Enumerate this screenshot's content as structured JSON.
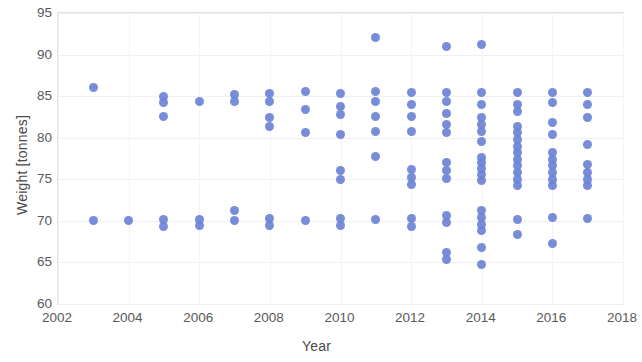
{
  "chart_data": {
    "type": "scatter",
    "title": "",
    "xlabel": "Year",
    "ylabel": "Weight [tonnes]",
    "xlim": [
      2002,
      2018
    ],
    "ylim": [
      60,
      95
    ],
    "xticks": [
      2002,
      2004,
      2006,
      2008,
      2010,
      2012,
      2014,
      2016,
      2018
    ],
    "yticks": [
      60,
      65,
      70,
      75,
      80,
      85,
      90,
      95
    ],
    "grid": true,
    "legend": null,
    "marker_color": "#6b83d6",
    "points": [
      {
        "x": 2003,
        "y": 86.0
      },
      {
        "x": 2003,
        "y": 70.0
      },
      {
        "x": 2004,
        "y": 70.1
      },
      {
        "x": 2005,
        "y": 85.0
      },
      {
        "x": 2005,
        "y": 84.2
      },
      {
        "x": 2005,
        "y": 82.6
      },
      {
        "x": 2005,
        "y": 70.2
      },
      {
        "x": 2005,
        "y": 69.3
      },
      {
        "x": 2006,
        "y": 84.3
      },
      {
        "x": 2006,
        "y": 70.2
      },
      {
        "x": 2006,
        "y": 69.4
      },
      {
        "x": 2007,
        "y": 85.2
      },
      {
        "x": 2007,
        "y": 84.3
      },
      {
        "x": 2007,
        "y": 71.2
      },
      {
        "x": 2007,
        "y": 70.1
      },
      {
        "x": 2008,
        "y": 85.3
      },
      {
        "x": 2008,
        "y": 84.4
      },
      {
        "x": 2008,
        "y": 82.4
      },
      {
        "x": 2008,
        "y": 81.4
      },
      {
        "x": 2008,
        "y": 70.3
      },
      {
        "x": 2008,
        "y": 69.4
      },
      {
        "x": 2009,
        "y": 85.5
      },
      {
        "x": 2009,
        "y": 83.4
      },
      {
        "x": 2009,
        "y": 80.6
      },
      {
        "x": 2009,
        "y": 70.1
      },
      {
        "x": 2010,
        "y": 85.3
      },
      {
        "x": 2010,
        "y": 83.8
      },
      {
        "x": 2010,
        "y": 82.8
      },
      {
        "x": 2010,
        "y": 80.4
      },
      {
        "x": 2010,
        "y": 76.0
      },
      {
        "x": 2010,
        "y": 75.0
      },
      {
        "x": 2010,
        "y": 70.3
      },
      {
        "x": 2010,
        "y": 69.4
      },
      {
        "x": 2011,
        "y": 92.0
      },
      {
        "x": 2011,
        "y": 85.5
      },
      {
        "x": 2011,
        "y": 84.4
      },
      {
        "x": 2011,
        "y": 82.6
      },
      {
        "x": 2011,
        "y": 80.8
      },
      {
        "x": 2011,
        "y": 77.8
      },
      {
        "x": 2011,
        "y": 70.2
      },
      {
        "x": 2012,
        "y": 85.4
      },
      {
        "x": 2012,
        "y": 84.0
      },
      {
        "x": 2012,
        "y": 82.6
      },
      {
        "x": 2012,
        "y": 80.8
      },
      {
        "x": 2012,
        "y": 76.2
      },
      {
        "x": 2012,
        "y": 75.2
      },
      {
        "x": 2012,
        "y": 74.4
      },
      {
        "x": 2012,
        "y": 70.3
      },
      {
        "x": 2012,
        "y": 69.3
      },
      {
        "x": 2013,
        "y": 91.0
      },
      {
        "x": 2013,
        "y": 85.4
      },
      {
        "x": 2013,
        "y": 84.4
      },
      {
        "x": 2013,
        "y": 82.9
      },
      {
        "x": 2013,
        "y": 81.6
      },
      {
        "x": 2013,
        "y": 80.6
      },
      {
        "x": 2013,
        "y": 77.0
      },
      {
        "x": 2013,
        "y": 76.0
      },
      {
        "x": 2013,
        "y": 75.1
      },
      {
        "x": 2013,
        "y": 70.6
      },
      {
        "x": 2013,
        "y": 69.8
      },
      {
        "x": 2013,
        "y": 66.2
      },
      {
        "x": 2013,
        "y": 65.3
      },
      {
        "x": 2014,
        "y": 91.2
      },
      {
        "x": 2014,
        "y": 85.4
      },
      {
        "x": 2014,
        "y": 84.0
      },
      {
        "x": 2014,
        "y": 82.4
      },
      {
        "x": 2014,
        "y": 81.6
      },
      {
        "x": 2014,
        "y": 80.8
      },
      {
        "x": 2014,
        "y": 79.6
      },
      {
        "x": 2014,
        "y": 77.6
      },
      {
        "x": 2014,
        "y": 77.0
      },
      {
        "x": 2014,
        "y": 76.3
      },
      {
        "x": 2014,
        "y": 75.6
      },
      {
        "x": 2014,
        "y": 74.8
      },
      {
        "x": 2014,
        "y": 71.2
      },
      {
        "x": 2014,
        "y": 70.4
      },
      {
        "x": 2014,
        "y": 69.6
      },
      {
        "x": 2014,
        "y": 68.8
      },
      {
        "x": 2014,
        "y": 66.8
      },
      {
        "x": 2014,
        "y": 64.7
      },
      {
        "x": 2015,
        "y": 85.4
      },
      {
        "x": 2015,
        "y": 84.0
      },
      {
        "x": 2015,
        "y": 83.2
      },
      {
        "x": 2015,
        "y": 81.4
      },
      {
        "x": 2015,
        "y": 80.6
      },
      {
        "x": 2015,
        "y": 79.8
      },
      {
        "x": 2015,
        "y": 79.0
      },
      {
        "x": 2015,
        "y": 78.2
      },
      {
        "x": 2015,
        "y": 77.4
      },
      {
        "x": 2015,
        "y": 76.6
      },
      {
        "x": 2015,
        "y": 75.8
      },
      {
        "x": 2015,
        "y": 75.0
      },
      {
        "x": 2015,
        "y": 74.2
      },
      {
        "x": 2015,
        "y": 70.2
      },
      {
        "x": 2015,
        "y": 68.3
      },
      {
        "x": 2016,
        "y": 85.4
      },
      {
        "x": 2016,
        "y": 84.2
      },
      {
        "x": 2016,
        "y": 81.8
      },
      {
        "x": 2016,
        "y": 80.4
      },
      {
        "x": 2016,
        "y": 78.2
      },
      {
        "x": 2016,
        "y": 77.4
      },
      {
        "x": 2016,
        "y": 76.6
      },
      {
        "x": 2016,
        "y": 75.8
      },
      {
        "x": 2016,
        "y": 75.0
      },
      {
        "x": 2016,
        "y": 74.2
      },
      {
        "x": 2016,
        "y": 70.4
      },
      {
        "x": 2016,
        "y": 67.3
      },
      {
        "x": 2017,
        "y": 85.4
      },
      {
        "x": 2017,
        "y": 84.0
      },
      {
        "x": 2017,
        "y": 82.4
      },
      {
        "x": 2017,
        "y": 79.2
      },
      {
        "x": 2017,
        "y": 76.8
      },
      {
        "x": 2017,
        "y": 75.8
      },
      {
        "x": 2017,
        "y": 75.0
      },
      {
        "x": 2017,
        "y": 74.2
      },
      {
        "x": 2017,
        "y": 70.3
      }
    ]
  }
}
